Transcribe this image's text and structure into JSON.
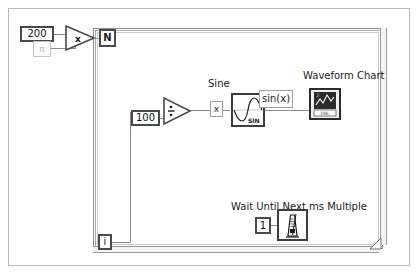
{
  "diagram": {
    "type": "for-loop-sine-chart"
  },
  "constants": {
    "count_value": "200",
    "pi_value": "π",
    "divisor_value": "100",
    "wait_value": "1"
  },
  "terminals": {
    "loop_count": "N",
    "loop_iteration": "i"
  },
  "operators": {
    "multiply_symbol": "x",
    "divide_symbol": "÷"
  },
  "labels": {
    "sine": "Sine",
    "sine_icon_text": "SIN",
    "sin_of_x": "sin(x)",
    "x_wire": "x",
    "waveform_chart": "Waveform Chart",
    "chart_data_type": "DBL",
    "wait_function": "Wait Until Next ms Multiple"
  },
  "icons": {
    "multiply": "multiply-operator-icon",
    "divide": "divide-operator-icon",
    "sine": "sine-function-icon",
    "chart": "waveform-chart-terminal-icon",
    "metronome": "wait-ms-metronome-icon",
    "resize": "loop-resize-handle-icon"
  },
  "colors": {
    "wire": "#8a8a8a",
    "border_dark": "#4a4a4a",
    "border_light": "#c3c3c3",
    "panel_border": "#b9b9b9",
    "background": "#ffffff",
    "text": "#1a1a1a",
    "dim_text": "#bdbdbd"
  }
}
